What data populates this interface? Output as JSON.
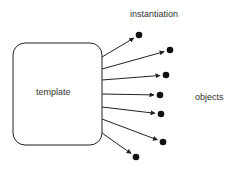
{
  "diagram": {
    "source": {
      "label": "template"
    },
    "edge_label": "instantiation",
    "targets_label": "objects",
    "targets": [
      {
        "x": 139,
        "y": 35,
        "from_y": 57
      },
      {
        "x": 170,
        "y": 50,
        "from_y": 69
      },
      {
        "x": 166,
        "y": 75,
        "from_y": 80
      },
      {
        "x": 160,
        "y": 95,
        "from_y": 94
      },
      {
        "x": 161,
        "y": 114,
        "from_y": 107
      },
      {
        "x": 163,
        "y": 142,
        "from_y": 119
      },
      {
        "x": 136,
        "y": 157,
        "from_y": 133
      }
    ],
    "colors": {
      "stroke": "#222222",
      "dot": "#111111",
      "text": "#333333"
    }
  }
}
